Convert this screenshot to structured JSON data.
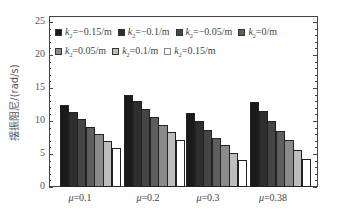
{
  "chart_data": {
    "type": "bar",
    "title": "",
    "xlabel": "",
    "ylabel": "摆振阻尼/(rad/s)",
    "ylim": [
      0,
      25
    ],
    "yticks": [
      0,
      5,
      10,
      15,
      20,
      25
    ],
    "grid": false,
    "legend_position": "top-inside",
    "categories": [
      "μ=0.1",
      "μ=0.2",
      "μ=0.3",
      "μ=0.38"
    ],
    "series": [
      {
        "name": "k2=-0.15/m",
        "color": "#1a1a1a",
        "values": [
          12.4,
          14.0,
          11.2,
          12.9
        ]
      },
      {
        "name": "k2=-0.1/m",
        "color": "#2e2e2e",
        "values": [
          11.3,
          13.0,
          10.0,
          11.5
        ]
      },
      {
        "name": "k2=-0.05/m",
        "color": "#454545",
        "values": [
          10.3,
          11.8,
          8.7,
          10.0
        ]
      },
      {
        "name": "k2=0/m",
        "color": "#5e5e5e",
        "values": [
          9.1,
          10.6,
          7.5,
          8.5
        ]
      },
      {
        "name": "k2=0.05/m",
        "color": "#8a8a8a",
        "values": [
          8.1,
          9.4,
          6.3,
          7.1
        ]
      },
      {
        "name": "k2=0.1/m",
        "color": "#bdbdbd",
        "values": [
          7.0,
          8.3,
          5.2,
          5.6
        ]
      },
      {
        "name": "k2=0.15/m",
        "color": "#ffffff",
        "values": [
          5.9,
          7.1,
          4.1,
          4.2
        ]
      }
    ]
  },
  "legend": {
    "row1": [
      {
        "prefix": "k",
        "sub": "2",
        "text": "=−0.15/m"
      },
      {
        "prefix": "k",
        "sub": "2",
        "text": "=−0.1/m"
      },
      {
        "prefix": "k",
        "sub": "2",
        "text": "=−0.05/m"
      },
      {
        "prefix": "k",
        "sub": "2",
        "text": "=0/m"
      }
    ],
    "row2": [
      {
        "prefix": "k",
        "sub": "2",
        "text": "=0.05/m"
      },
      {
        "prefix": "k",
        "sub": "2",
        "text": "=0.1/m"
      },
      {
        "prefix": "k",
        "sub": "2",
        "text": "=0.15/m"
      }
    ]
  },
  "axis": {
    "ylabel": "摆振阻尼/(rad/s)",
    "xlabels": [
      {
        "mu": "μ",
        "text": "=0.1"
      },
      {
        "mu": "μ",
        "text": "=0.2"
      },
      {
        "mu": "μ",
        "text": "=0.3"
      },
      {
        "mu": "μ",
        "text": "=0.38"
      }
    ]
  }
}
